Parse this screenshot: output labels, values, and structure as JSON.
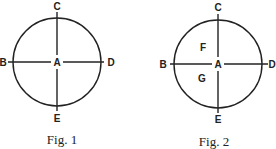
{
  "figures": [
    {
      "caption": "Fig. 1",
      "center_label": "A",
      "top_label": "C",
      "left_label": "B",
      "right_label": "D",
      "bottom_label": "E"
    },
    {
      "caption": "Fig. 2",
      "center_label": "A",
      "top_label": "C",
      "left_label": "B",
      "right_label": "D",
      "bottom_label": "E",
      "upper_left_label": "F",
      "lower_left_label": "G"
    }
  ],
  "colors": {
    "ink": "#222222",
    "background": "#ffffff"
  }
}
